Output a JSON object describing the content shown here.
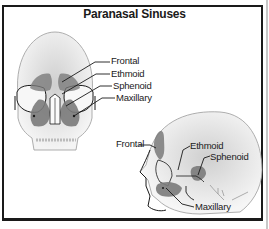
{
  "title": "Paranasal Sinuses",
  "front_view": {
    "labels": [
      "Frontal",
      "Ethmoid",
      "Sphenoid",
      "Maxillary"
    ]
  },
  "side_view": {
    "labels": {
      "frontal": "Frontal",
      "ethmoid": "Ethmoid",
      "sphenoid": "Sphenoid",
      "maxillary": "Maxillary"
    }
  },
  "colors": {
    "sinus_fill": "#7a7a7a",
    "skull_shade": "#d9d9d9",
    "outline": "#1a1a1a",
    "frame": "#1a1a1a"
  }
}
